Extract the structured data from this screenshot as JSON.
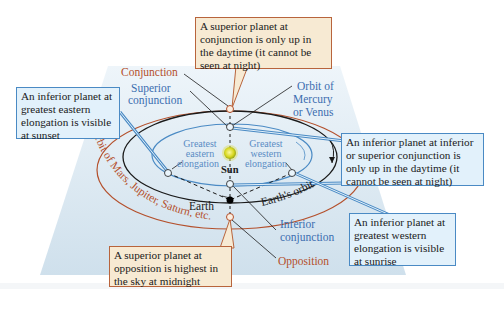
{
  "diagram": {
    "colors": {
      "background_panel": "#dbe8f1",
      "orange_box_fill": "#f7ead3",
      "orange_box_border": "#b8643c",
      "blue_box_fill": "#e2f1fb",
      "blue_box_border": "#4a8ac4",
      "superior_orbit": "#b4502c",
      "inferior_orbit": "#4a8ac4",
      "earth_orbit": "#1a1a1a"
    },
    "labels": {
      "conjunction": "Conjunction",
      "superior_conjunction_1": "Superior",
      "superior_conjunction_2": "conjunction",
      "orbit_inferior_1": "Orbit of",
      "orbit_inferior_2": "Mercury",
      "orbit_inferior_3": "or Venus",
      "greatest_eastern_1": "Greatest",
      "greatest_eastern_2": "eastern",
      "greatest_eastern_3": "elongation",
      "greatest_western_1": "Greatest",
      "greatest_western_2": "western",
      "greatest_western_3": "elongation",
      "sun": "Sun",
      "earth": "Earth",
      "earths_orbit": "Earth's orbit",
      "orbit_superior": "Orbit of Mars, Jupiter, Saturn, etc.",
      "inferior_conjunction_1": "Inferior",
      "inferior_conjunction_2": "conjunction",
      "opposition": "Opposition"
    },
    "callouts": {
      "superior_conjunction": "A superior planet at conjunction is only up in the daytime (it cannot be seen at night)",
      "eastern_elongation": "An inferior planet at greatest eastern elongation is visible at  sunset",
      "inferior_conjunction": "An inferior planet at inferior or superior conjunction is only up in the daytime (it cannot be seen at night)",
      "western_elongation": "An inferior planet at greatest western elongation is visible at sunrise",
      "opposition": "A superior planet at opposition is highest in the sky at midnight"
    }
  }
}
